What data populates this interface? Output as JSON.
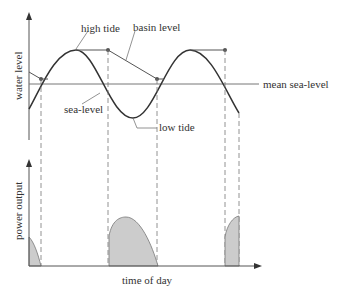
{
  "upper_plot": {
    "y_axis_label": "water level",
    "labels": {
      "high_tide": "high tide",
      "basin_level": "basin level",
      "mean_sea_level": "mean sea-level",
      "sea_level": "sea-level",
      "low_tide": "low tide"
    }
  },
  "lower_plot": {
    "y_axis_label": "power output",
    "x_axis_label": "time of day"
  },
  "colors": {
    "line": "#333333",
    "axis": "#555555",
    "fill": "#cccccc",
    "dashed": "#777777"
  }
}
